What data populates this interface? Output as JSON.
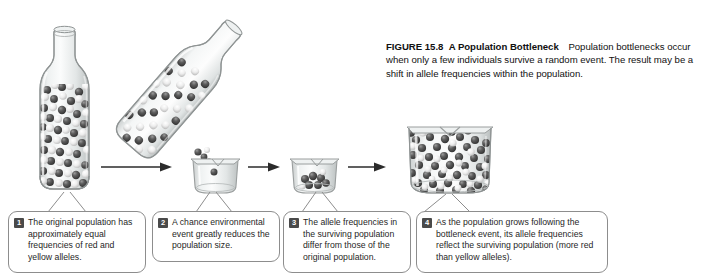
{
  "figure": {
    "label": "FIGURE 15.8",
    "title": "A Population Bottleneck",
    "caption": "Population bottlenecks occur when only a few individuals survive a random event. The result may be a shift in allele frequencies within the population."
  },
  "steps": [
    {
      "number": "1",
      "text": "The original population has approximately equal frequencies of red and yellow alleles.",
      "vessel": "tall-bottle-upright"
    },
    {
      "number": "2",
      "text": "A chance environmental event greatly reduces the population size.",
      "vessel": "tall-bottle-tilted-pouring"
    },
    {
      "number": "3",
      "text": "The allele frequencies in the surviving population differ from those of the original population.",
      "vessel": "small-beaker-few-marbles"
    },
    {
      "number": "4",
      "text": "As the population grows following the bottleneck event, its allele frequencies reflect the surviving population (more red than yellow alleles).",
      "vessel": "large-beaker-full"
    }
  ],
  "legend_meaning": {
    "dark_marble": "red allele",
    "light_marble": "yellow allele"
  },
  "colors": {
    "marble_dark": "#4e4e4e",
    "marble_light": "#f2f2f2",
    "glass": "#d9dcdc",
    "glass_outline": "#9a9e9e",
    "arrow": "#2b2b2b",
    "callout_border": "#8d8d8d",
    "badge": "#4a4a4a",
    "text": "#1f1f1f",
    "background": "#ffffff"
  },
  "arrows": [
    {
      "name": "arrow-stage1-to-stage2"
    },
    {
      "name": "arrow-stage2-to-stage3"
    },
    {
      "name": "arrow-stage3-to-stage4"
    }
  ]
}
